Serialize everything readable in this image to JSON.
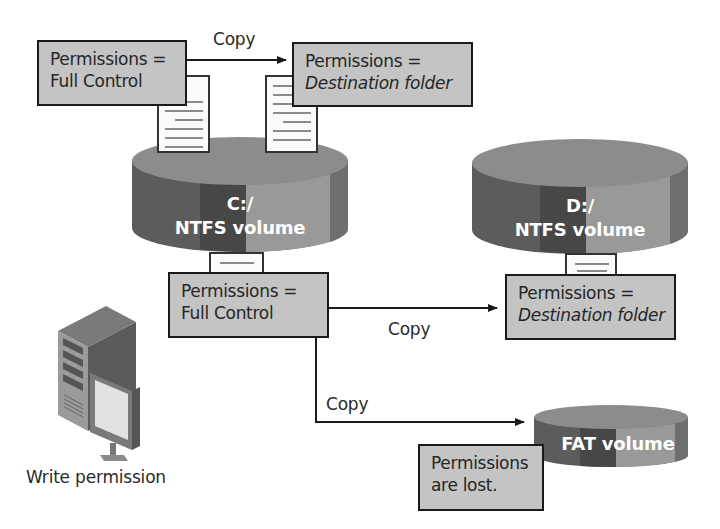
{
  "diagram": {
    "source_permissions_top": {
      "line1": "Permissions =",
      "line2": "Full Control"
    },
    "copy_top_label": "Copy",
    "dest_permissions_top": {
      "line1": "Permissions =",
      "line2": "Destination folder"
    },
    "volume_c": {
      "line1": "C:/",
      "line2": "NTFS volume"
    },
    "volume_d": {
      "line1": "D:/",
      "line2": "NTFS volume"
    },
    "source_permissions_mid": {
      "line1": "Permissions =",
      "line2": "Full Control"
    },
    "copy_to_d_label": "Copy",
    "dest_permissions_d": {
      "line1": "Permissions =",
      "line2": "Destination folder"
    },
    "copy_to_fat_label": "Copy",
    "volume_fat": {
      "label": "FAT volume"
    },
    "fat_result": {
      "line1": "Permissions",
      "line2": "are lost."
    },
    "computer_caption": "Write permission"
  },
  "colors": {
    "box_fill": "#c4c4c4",
    "box_border": "#1a1a1a",
    "cylinder_top": "#8a8a8a",
    "cylinder_dark": "#5a5a5a",
    "cylinder_mid": "#4a4a4a",
    "cylinder_light": "#9a9a9a"
  }
}
